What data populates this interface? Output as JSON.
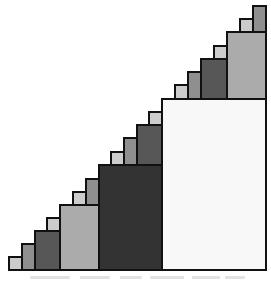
{
  "figure": {
    "colors": {
      "white": "#f8f8f8",
      "light": "#cccccc",
      "medium": "#8f8f8f",
      "lightgrey": "#ababab",
      "dark": "#575757",
      "darkest": "#333333",
      "outline": "#111111"
    },
    "caption": ""
  }
}
